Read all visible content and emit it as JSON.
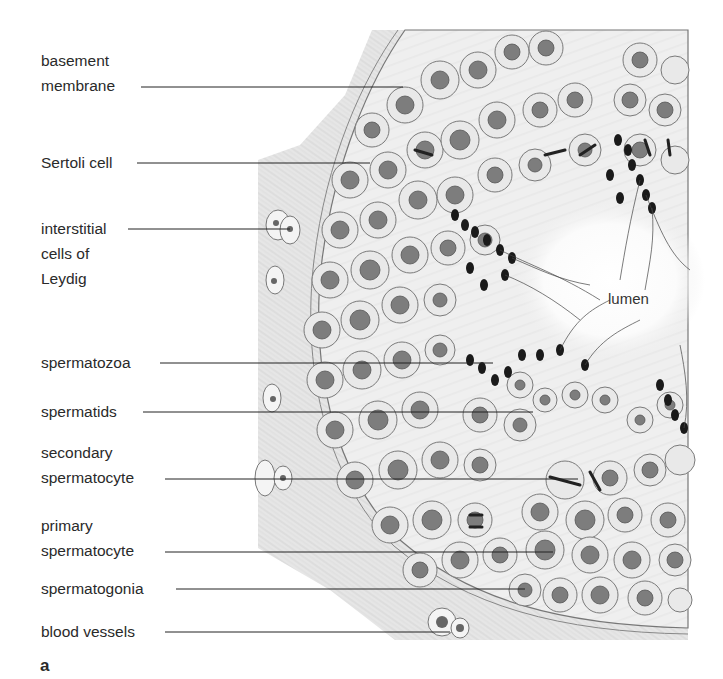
{
  "figure": {
    "panel_letter": "a",
    "region_label": "lumen",
    "labels": [
      {
        "lines": [
          "basement",
          "membrane"
        ],
        "text_x": 41,
        "text_y": 48,
        "line_y": 87,
        "line_x1": 141,
        "line_x2": 403
      },
      {
        "lines": [
          "Sertoli cell"
        ],
        "text_x": 41,
        "text_y": 150,
        "line_y": 163,
        "line_x1": 137,
        "line_x2": 370
      },
      {
        "lines": [
          "interstitial",
          "cells of",
          "Leydig"
        ],
        "text_x": 41,
        "text_y": 216,
        "line_y": 229,
        "line_x1": 128,
        "line_x2": 290
      },
      {
        "lines": [
          "spermatozoa"
        ],
        "text_x": 41,
        "text_y": 350,
        "line_y": 363,
        "line_x1": 160,
        "line_x2": 493
      },
      {
        "lines": [
          "spermatids"
        ],
        "text_x": 41,
        "text_y": 399,
        "line_y": 412,
        "line_x1": 143,
        "line_x2": 533
      },
      {
        "lines": [
          "secondary",
          "spermatocyte"
        ],
        "text_x": 41,
        "text_y": 440,
        "line_y": 479,
        "line_x1": 165,
        "line_x2": 578
      },
      {
        "lines": [
          "primary",
          "spermatocyte"
        ],
        "text_x": 41,
        "text_y": 513,
        "line_y": 552,
        "line_x1": 165,
        "line_x2": 553
      },
      {
        "lines": [
          "spermatogonia"
        ],
        "text_x": 41,
        "text_y": 576,
        "line_y": 589,
        "line_x1": 176,
        "line_x2": 525
      },
      {
        "lines": [
          "blood vessels"
        ],
        "text_x": 41,
        "text_y": 619,
        "line_y": 632,
        "line_x1": 165,
        "line_x2": 450
      }
    ]
  }
}
